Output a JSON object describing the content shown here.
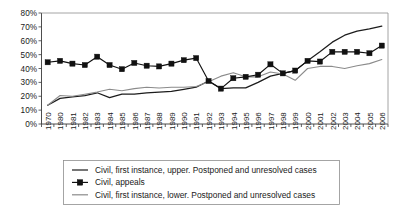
{
  "chart_data": {
    "type": "line",
    "title": "",
    "subtitle": "",
    "xlabel": "",
    "ylabel": "",
    "ylim": [
      0,
      80
    ],
    "ytick_labels": [
      "0%",
      "10%",
      "20%",
      "30%",
      "40%",
      "50%",
      "60%",
      "70%",
      "80%"
    ],
    "ytick_values": [
      0,
      10,
      20,
      30,
      40,
      50,
      60,
      70,
      80
    ],
    "grid": false,
    "legend_position": "bottom",
    "categories": [
      "1970",
      "1980",
      "1981",
      "1982",
      "1983",
      "1984",
      "1985",
      "1986",
      "1987",
      "1988",
      "1989",
      "1990",
      "1991",
      "1992",
      "1993",
      "1994",
      "1995",
      "1996",
      "1997",
      "1998",
      "1999",
      "2000",
      "2001",
      "2002",
      "2003",
      "2004",
      "2005",
      "2006"
    ],
    "series": [
      {
        "name": "Civil, first instance, upper. Postponed and unresolved cases",
        "color": "#1c1c1c",
        "marker": "none",
        "values": [
          13.5,
          18.5,
          19.5,
          20.5,
          22.5,
          19.0,
          21.5,
          21.5,
          22.5,
          23.0,
          23.5,
          25.0,
          26.5,
          31.0,
          25.5,
          26.0,
          26.0,
          30.0,
          34.5,
          36.5,
          38.5,
          45.5,
          52.0,
          59.0,
          64.0,
          67.0,
          68.5,
          70.5
        ]
      },
      {
        "name": "Civil, appeals",
        "color": "#111111",
        "marker": "square",
        "values": [
          44.5,
          45.5,
          43.5,
          42.5,
          48.5,
          42.5,
          39.5,
          44.0,
          42.0,
          41.5,
          43.5,
          46.0,
          47.5,
          31.0,
          25.5,
          33.0,
          34.0,
          35.5,
          43.0,
          36.5,
          38.5,
          45.5,
          45.0,
          52.0,
          52.0,
          52.0,
          51.0,
          56.5
        ]
      },
      {
        "name": "Civil, first instance, lower. Postponed and unresolved cases",
        "color": "#8b8b8b",
        "marker": "none",
        "values": [
          13.5,
          20.5,
          20.0,
          21.5,
          23.0,
          25.0,
          24.0,
          25.5,
          26.5,
          26.0,
          26.5,
          26.5,
          27.0,
          30.5,
          34.5,
          37.0,
          34.0,
          34.0,
          37.5,
          36.0,
          31.5,
          40.0,
          41.5,
          41.5,
          40.0,
          42.0,
          43.5,
          46.5
        ]
      }
    ]
  },
  "legend": {
    "items": [
      {
        "label": "Civil, first instance, upper. Postponed and unresolved cases",
        "marker": "line",
        "color": "#1c1c1c"
      },
      {
        "label": "Civil, appeals",
        "marker": "line-square",
        "color": "#111111"
      },
      {
        "label": "Civil, first instance, lower. Postponed and unresolved cases",
        "marker": "line",
        "color": "#8b8b8b"
      }
    ]
  }
}
